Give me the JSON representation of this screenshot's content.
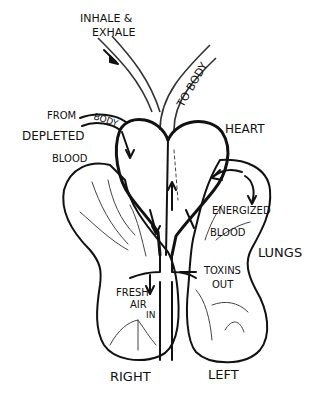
{
  "diagram": {
    "labels": {
      "inhale_exhale_line1": "INHALE &",
      "inhale_exhale_line2": "EXHALE",
      "to_body": "TO BODY",
      "from_body_from": "FROM",
      "from_body_body": "BODY",
      "depleted": "DEPLETED",
      "depleted_blood": "BLOOD",
      "heart": "HEART",
      "energized": "ENERGIZED",
      "energized_blood": "BLOOD",
      "lungs": "LUNGS",
      "toxins": "TOXINS",
      "toxins_out": "OUT",
      "fresh": "FRESH",
      "air": "AIR",
      "in": "IN",
      "right": "RIGHT",
      "left": "LEFT"
    },
    "colors": {
      "ink": "#111111",
      "background": "#ffffff"
    }
  }
}
